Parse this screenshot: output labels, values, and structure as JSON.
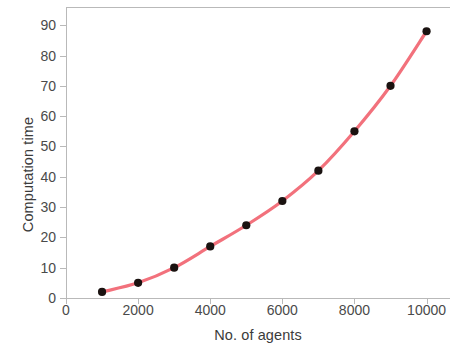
{
  "chart_data": {
    "type": "line",
    "title": "",
    "xlabel": "No. of agents",
    "ylabel": "Computation time",
    "x": [
      1000,
      2000,
      3000,
      4000,
      5000,
      6000,
      7000,
      8000,
      9000,
      10000
    ],
    "values": [
      2,
      5,
      10,
      17,
      24,
      32,
      42,
      55,
      70,
      88
    ],
    "series": [
      {
        "name": "Computation time",
        "values": [
          2,
          5,
          10,
          17,
          24,
          32,
          42,
          55,
          70,
          88
        ]
      }
    ],
    "xlim": [
      0,
      10650
    ],
    "ylim": [
      0,
      96
    ],
    "xticks": [
      0,
      2000,
      4000,
      6000,
      8000,
      10000
    ],
    "xtick_labels": [
      "0",
      "2000",
      "4000",
      "6000",
      "8000",
      "10000"
    ],
    "yticks": [
      0,
      10,
      20,
      30,
      40,
      50,
      60,
      70,
      80,
      90
    ],
    "ytick_labels": [
      "0",
      "10",
      "20",
      "30",
      "40",
      "50",
      "60",
      "70",
      "80",
      "90"
    ],
    "grid": false,
    "legend": "none",
    "line_color": "#f2717c",
    "marker_color": "#1a1210",
    "marker_shape": "circle",
    "axis_color": "#b9b9b9",
    "background_color": "#ffffff"
  }
}
